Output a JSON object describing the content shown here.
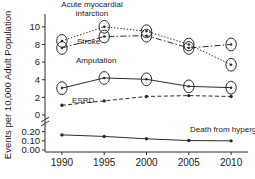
{
  "chart_data": {
    "type": "line",
    "title": "",
    "subtitle": "",
    "xlabel": "",
    "ylabel": "Events per 10,000 Adult Population",
    "x": [
      1990,
      1995,
      2000,
      2005,
      2010
    ],
    "xtick_labels": [
      "1990",
      "1995",
      "2000",
      "2005",
      "2010"
    ],
    "xlim": [
      1988,
      2012
    ],
    "grid": false,
    "legend": "annotations-on-plot",
    "broken_axis": true,
    "upper_panel": {
      "ylim": [
        0,
        11
      ],
      "ytick_labels": [
        "0",
        "2",
        "4",
        "6",
        "8",
        "10"
      ],
      "yticks": [
        0,
        2,
        4,
        6,
        8,
        10
      ]
    },
    "lower_panel": {
      "ylim": [
        0.0,
        0.24
      ],
      "ytick_labels": [
        "0.00",
        "0.10",
        "0.20"
      ],
      "yticks": [
        0.0,
        0.1,
        0.2
      ]
    },
    "series": [
      {
        "name": "Acute myocardial infarction",
        "label_lines": [
          "Acute myocardial",
          "infarction"
        ],
        "panel": "upper",
        "line_style": "dotted",
        "marker": "circle-dot",
        "values": [
          8.4,
          10.0,
          9.5,
          8.0,
          5.7
        ]
      },
      {
        "name": "Stroke",
        "label_lines": [
          "Stroke"
        ],
        "panel": "upper",
        "line_style": "dash-dot",
        "marker": "circle-dot",
        "values": [
          7.6,
          8.9,
          9.0,
          7.6,
          8.0
        ]
      },
      {
        "name": "Amputation",
        "label_lines": [
          "Amputation"
        ],
        "panel": "upper",
        "line_style": "solid",
        "marker": "circle-dot",
        "values": [
          3.05,
          4.2,
          4.05,
          3.25,
          3.1
        ]
      },
      {
        "name": "ESRD",
        "label_lines": [
          "ESRD"
        ],
        "panel": "upper",
        "line_style": "dashed",
        "marker": "dot",
        "values": [
          1.1,
          1.6,
          2.1,
          2.2,
          2.1
        ]
      },
      {
        "name": "Death from hyperglycemic crisis",
        "label_lines": [
          "Death from hyperglycemic crisis"
        ],
        "panel": "lower",
        "line_style": "solid",
        "marker": "dot",
        "values": [
          0.165,
          0.148,
          0.122,
          0.103,
          0.1
        ]
      }
    ],
    "annotations": [
      {
        "id": "ami-label",
        "text_lines": [
          "Acute myocardial",
          "infarction"
        ],
        "x": 92,
        "y": 7
      },
      {
        "id": "stroke-label",
        "text_lines": [
          "Stroke"
        ],
        "x": 77,
        "y": 44
      },
      {
        "id": "amp-label",
        "text_lines": [
          "Amputation"
        ],
        "x": 76,
        "y": 63
      },
      {
        "id": "esrd-label",
        "text_lines": [
          "ESRD"
        ],
        "x": 72,
        "y": 103
      },
      {
        "id": "death-label",
        "text_lines": [
          "Death from hyperglycemic crisis"
        ],
        "x": 190,
        "y": 132
      }
    ]
  }
}
